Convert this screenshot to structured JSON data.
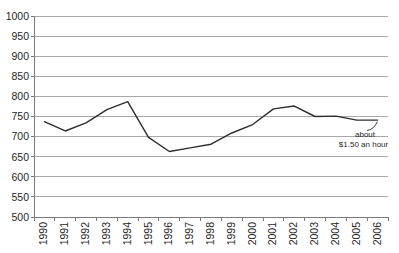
{
  "chart_data": {
    "type": "line",
    "title": "",
    "xlabel": "",
    "ylabel": "",
    "categories": [
      "1990",
      "1991",
      "1992",
      "1993",
      "1994",
      "1995",
      "1996",
      "1997",
      "1998",
      "1999",
      "2000",
      "2001",
      "2002",
      "2003",
      "2004",
      "2005",
      "2006"
    ],
    "series": [
      {
        "name": "",
        "values": [
          737,
          714,
          734,
          767,
          787,
          698,
          663,
          672,
          681,
          709,
          730,
          769,
          776,
          750,
          751,
          741,
          741
        ]
      }
    ],
    "ylim": [
      500,
      1000
    ],
    "ytick_step": 50,
    "yticks": [
      500,
      550,
      600,
      650,
      700,
      750,
      800,
      850,
      900,
      950,
      1000
    ],
    "grid": true,
    "legend": "none",
    "annotation": {
      "line1": "about",
      "line2": "$1.50 an hour"
    },
    "colors": {
      "background": "#ffffff",
      "gridline": "#a8a8a8",
      "axis": "#7a7a7a",
      "series_line": "#2e2e2e",
      "label_text": "#1f1f1f"
    }
  }
}
